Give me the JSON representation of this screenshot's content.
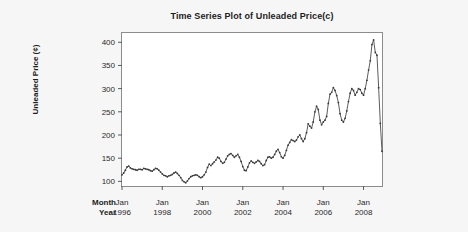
{
  "chart_data": {
    "type": "line",
    "title": "Time Series Plot of Unleaded Price(c)",
    "xlabel": "",
    "ylabel": "Unleaded Price (¢)",
    "ylim": [
      90,
      420
    ],
    "yticks": [
      100,
      150,
      200,
      250,
      300,
      350,
      400
    ],
    "ytick_labels": [
      "100",
      "150",
      "200",
      "250",
      "300",
      "350",
      "400"
    ],
    "grid": false,
    "legend": null,
    "axis_row_labels": {
      "month": "Month",
      "year": "Year"
    },
    "xticks": [
      {
        "month": "Jan",
        "year": "1996"
      },
      {
        "month": "Jan",
        "year": "1998"
      },
      {
        "month": "Jan",
        "year": "2000"
      },
      {
        "month": "Jan",
        "year": "2002"
      },
      {
        "month": "Jan",
        "year": "2004"
      },
      {
        "month": "Jan",
        "year": "2006"
      },
      {
        "month": "Jan",
        "year": "2008"
      }
    ],
    "x_start": "1996-01",
    "x_end": "2008-12",
    "x_step_months": 1,
    "series": [
      {
        "name": "Unleaded Price",
        "marker": "dot",
        "color": "#3a3a3a",
        "values": [
          114,
          118,
          124,
          131,
          133,
          129,
          127,
          126,
          125,
          124,
          126,
          126,
          125,
          128,
          127,
          126,
          125,
          123,
          122,
          125,
          128,
          127,
          124,
          120,
          116,
          113,
          112,
          110,
          112,
          113,
          115,
          118,
          120,
          117,
          113,
          108,
          102,
          99,
          97,
          101,
          106,
          110,
          112,
          113,
          114,
          113,
          110,
          108,
          110,
          114,
          120,
          130,
          137,
          134,
          138,
          142,
          146,
          152,
          150,
          143,
          139,
          141,
          148,
          155,
          158,
          160,
          156,
          152,
          155,
          158,
          152,
          143,
          132,
          124,
          123,
          131,
          140,
          144,
          141,
          139,
          142,
          145,
          143,
          138,
          134,
          136,
          145,
          152,
          153,
          150,
          152,
          158,
          165,
          169,
          162,
          153,
          150,
          156,
          167,
          178,
          184,
          190,
          188,
          186,
          189,
          196,
          200,
          192,
          186,
          192,
          205,
          224,
          219,
          215,
          228,
          250,
          262,
          255,
          232,
          222,
          228,
          232,
          240,
          268,
          288,
          292,
          302,
          296,
          285,
          270,
          246,
          232,
          228,
          236,
          252,
          272,
          290,
          300,
          296,
          286,
          292,
          300,
          298,
          290,
          286,
          300,
          318,
          340,
          360,
          395,
          405,
          378,
          372,
          302,
          225,
          165
        ]
      }
    ]
  }
}
